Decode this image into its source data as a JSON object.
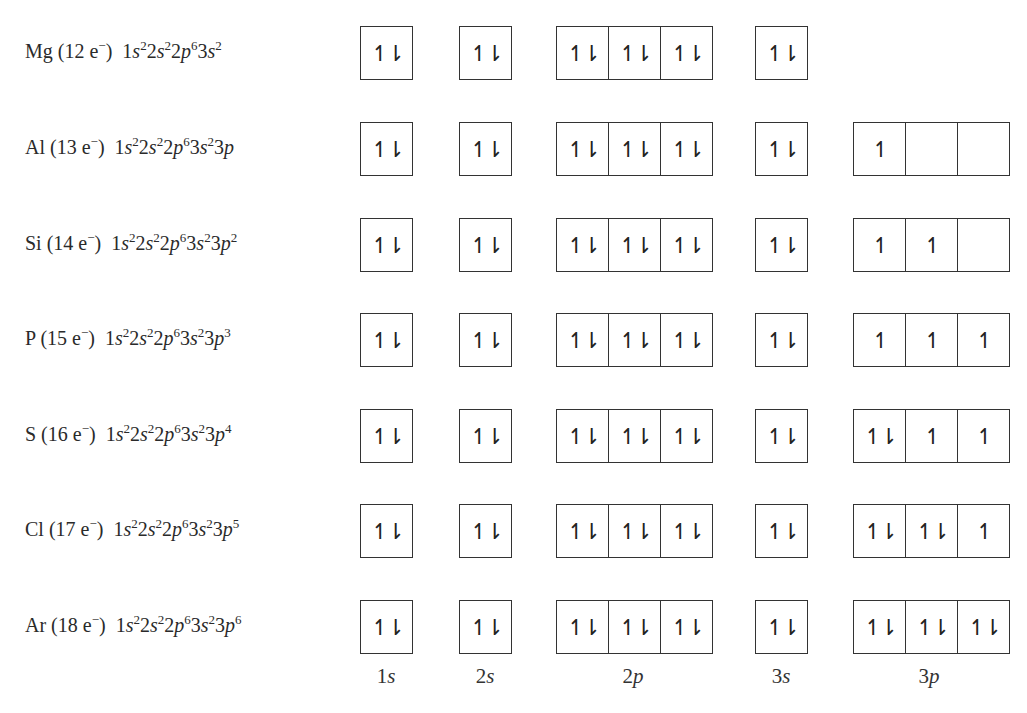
{
  "orbital_columns": [
    {
      "name": "1s",
      "num": "1",
      "letter": "s",
      "cells": 1,
      "left": 360,
      "center": 386
    },
    {
      "name": "2s",
      "num": "2",
      "letter": "s",
      "cells": 1,
      "left": 459,
      "center": 485
    },
    {
      "name": "2p",
      "num": "2",
      "letter": "p",
      "cells": 3,
      "left": 556,
      "center": 633
    },
    {
      "name": "3s",
      "num": "3",
      "letter": "s",
      "cells": 1,
      "left": 755,
      "center": 781
    },
    {
      "name": "3p",
      "num": "3",
      "letter": "p",
      "cells": 3,
      "left": 853,
      "center": 929
    }
  ],
  "symbols": {
    "paired": "↿⇂",
    "single": "↿",
    "empty": ""
  },
  "elements": [
    {
      "symbol": "Mg",
      "electrons": "12",
      "label": "Mg (12 e⁻)",
      "config": "1s²2s²2p⁶3s²",
      "config_parts": [
        [
          "1",
          "s",
          "2"
        ],
        [
          "2",
          "s",
          "2"
        ],
        [
          "2",
          "p",
          "6"
        ],
        [
          "3",
          "s",
          "2"
        ]
      ],
      "orbitals": {
        "1s": [
          "↿⇂"
        ],
        "2s": [
          "↿⇂"
        ],
        "2p": [
          "↿⇂",
          "↿⇂",
          "↿⇂"
        ],
        "3s": [
          "↿⇂"
        ],
        "3p": null
      }
    },
    {
      "symbol": "Al",
      "electrons": "13",
      "label": "Al (13 e⁻)",
      "config": "1s²2s²2p⁶3s²3p",
      "config_parts": [
        [
          "1",
          "s",
          "2"
        ],
        [
          "2",
          "s",
          "2"
        ],
        [
          "2",
          "p",
          "6"
        ],
        [
          "3",
          "s",
          "2"
        ],
        [
          "3",
          "p",
          ""
        ]
      ],
      "orbitals": {
        "1s": [
          "↿⇂"
        ],
        "2s": [
          "↿⇂"
        ],
        "2p": [
          "↿⇂",
          "↿⇂",
          "↿⇂"
        ],
        "3s": [
          "↿⇂"
        ],
        "3p": [
          "↿",
          "",
          ""
        ]
      }
    },
    {
      "symbol": "Si",
      "electrons": "14",
      "label": "Si (14 e⁻)",
      "config": "1s²2s²2p⁶3s²3p²",
      "config_parts": [
        [
          "1",
          "s",
          "2"
        ],
        [
          "2",
          "s",
          "2"
        ],
        [
          "2",
          "p",
          "6"
        ],
        [
          "3",
          "s",
          "2"
        ],
        [
          "3",
          "p",
          "2"
        ]
      ],
      "orbitals": {
        "1s": [
          "↿⇂"
        ],
        "2s": [
          "↿⇂"
        ],
        "2p": [
          "↿⇂",
          "↿⇂",
          "↿⇂"
        ],
        "3s": [
          "↿⇂"
        ],
        "3p": [
          "↿",
          "↿",
          ""
        ]
      }
    },
    {
      "symbol": "P",
      "electrons": "15",
      "label": "P (15 e⁻)",
      "config": "1s²2s²2p⁶3s²3p³",
      "config_parts": [
        [
          "1",
          "s",
          "2"
        ],
        [
          "2",
          "s",
          "2"
        ],
        [
          "2",
          "p",
          "6"
        ],
        [
          "3",
          "s",
          "2"
        ],
        [
          "3",
          "p",
          "3"
        ]
      ],
      "orbitals": {
        "1s": [
          "↿⇂"
        ],
        "2s": [
          "↿⇂"
        ],
        "2p": [
          "↿⇂",
          "↿⇂",
          "↿⇂"
        ],
        "3s": [
          "↿⇂"
        ],
        "3p": [
          "↿",
          "↿",
          "↿"
        ]
      }
    },
    {
      "symbol": "S",
      "electrons": "16",
      "label": "S (16 e⁻)",
      "config": "1s²2s²2p⁶3s²3p⁴",
      "config_parts": [
        [
          "1",
          "s",
          "2"
        ],
        [
          "2",
          "s",
          "2"
        ],
        [
          "2",
          "p",
          "6"
        ],
        [
          "3",
          "s",
          "2"
        ],
        [
          "3",
          "p",
          "4"
        ]
      ],
      "orbitals": {
        "1s": [
          "↿⇂"
        ],
        "2s": [
          "↿⇂"
        ],
        "2p": [
          "↿⇂",
          "↿⇂",
          "↿⇂"
        ],
        "3s": [
          "↿⇂"
        ],
        "3p": [
          "↿⇂",
          "↿",
          "↿"
        ]
      }
    },
    {
      "symbol": "Cl",
      "electrons": "17",
      "label": "Cl (17 e⁻)",
      "config": "1s²2s²2p⁶3s²3p⁵",
      "config_parts": [
        [
          "1",
          "s",
          "2"
        ],
        [
          "2",
          "s",
          "2"
        ],
        [
          "2",
          "p",
          "6"
        ],
        [
          "3",
          "s",
          "2"
        ],
        [
          "3",
          "p",
          "5"
        ]
      ],
      "orbitals": {
        "1s": [
          "↿⇂"
        ],
        "2s": [
          "↿⇂"
        ],
        "2p": [
          "↿⇂",
          "↿⇂",
          "↿⇂"
        ],
        "3s": [
          "↿⇂"
        ],
        "3p": [
          "↿⇂",
          "↿⇂",
          "↿"
        ]
      }
    },
    {
      "symbol": "Ar",
      "electrons": "18",
      "label": "Ar (18 e⁻)",
      "config": "1s²2s²2p⁶3s²3p⁶",
      "config_parts": [
        [
          "1",
          "s",
          "2"
        ],
        [
          "2",
          "s",
          "2"
        ],
        [
          "2",
          "p",
          "6"
        ],
        [
          "3",
          "s",
          "2"
        ],
        [
          "3",
          "p",
          "6"
        ]
      ],
      "orbitals": {
        "1s": [
          "↿⇂"
        ],
        "2s": [
          "↿⇂"
        ],
        "2p": [
          "↿⇂",
          "↿⇂",
          "↿⇂"
        ],
        "3s": [
          "↿⇂"
        ],
        "3p": [
          "↿⇂",
          "↿⇂",
          "↿⇂"
        ]
      }
    }
  ]
}
